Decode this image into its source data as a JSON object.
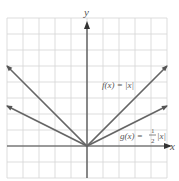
{
  "chart_data": {
    "type": "line",
    "title": "",
    "xlabel": "x",
    "ylabel": "y",
    "xlim": [
      -5,
      5
    ],
    "ylim": [
      -2,
      8
    ],
    "grid": true,
    "series": [
      {
        "name": "f(x) = |x|",
        "label": "f(x) = |x|",
        "x": [
          -5,
          0,
          5
        ],
        "y": [
          5,
          0,
          5
        ]
      },
      {
        "name": "g(x) = 1/2 |x|",
        "label_prefix": "g(x) =",
        "label_frac_num": "1",
        "label_frac_den": "2",
        "label_suffix": "|x|",
        "x": [
          -5,
          0,
          5
        ],
        "y": [
          2.5,
          0,
          2.5
        ]
      }
    ]
  },
  "axes": {
    "x_label": "x",
    "y_label": "y"
  },
  "labels": {
    "f_label": "f(x) = |x|",
    "g_prefix": "g(x) =",
    "g_num": "1",
    "g_den": "2",
    "g_suffix": "|x|"
  },
  "colors": {
    "grid": "#d4d4d4",
    "axis": "#444444",
    "line": "#666666",
    "text": "#555555"
  }
}
